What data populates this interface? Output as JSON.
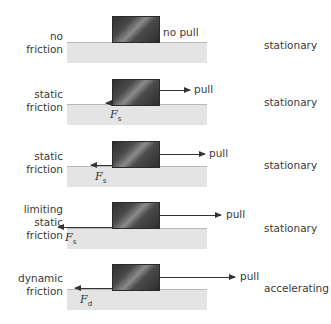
{
  "diagram": {
    "rows": [
      {
        "friction_label": "no\nfriction",
        "pull_label": "no pull",
        "state": "stationary",
        "has_pull_arrow": false,
        "has_friction_arrow": false
      },
      {
        "friction_label": "static\nfriction",
        "pull_label": "pull",
        "state": "stationary",
        "force_symbol": "F",
        "force_subscript": "s",
        "relative_force": "small"
      },
      {
        "friction_label": "static\nfriction",
        "pull_label": "pull",
        "state": "stationary",
        "force_symbol": "F",
        "force_subscript": "s",
        "relative_force": "medium"
      },
      {
        "friction_label": "limiting\nstatic\nfriction",
        "pull_label": "pull",
        "state": "stationary",
        "force_symbol": "F",
        "force_subscript": "s",
        "relative_force": "maximum"
      },
      {
        "friction_label": "dynamic\nfriction",
        "pull_label": "pull",
        "state": "accelerating",
        "force_symbol": "F",
        "force_subscript": "d",
        "relative_force": "pull exceeds friction"
      }
    ]
  },
  "colors": {
    "surface": "#e4e4e4",
    "surface_edge": "#b9b9b9",
    "block_dark": "#2f2f2f",
    "block_highlight": "#8a8a8a",
    "arrow": "#333333",
    "text": "#3a3a3a"
  }
}
